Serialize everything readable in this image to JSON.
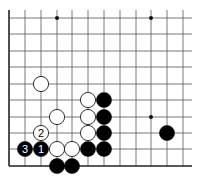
{
  "diagram": {
    "type": "go-board-fragment",
    "grid": {
      "columns_x": [
        9,
        25,
        41,
        57,
        72,
        88,
        104,
        120,
        136,
        151,
        167,
        183
      ],
      "rows_y": [
        18,
        34,
        51,
        67,
        84,
        100,
        117,
        133,
        149,
        166
      ],
      "extend_top_y": 10,
      "extend_right_x": 192,
      "left_edge": true,
      "bottom_edge": true,
      "line_color": "#555555",
      "edge_color": "#222222"
    },
    "star_points": [
      {
        "col": 3,
        "row": 0
      },
      {
        "col": 9,
        "row": 0
      },
      {
        "col": 9,
        "row": 6
      }
    ],
    "stones": [
      {
        "color": "white",
        "col": 2,
        "row": 4,
        "label": ""
      },
      {
        "color": "white",
        "col": 5,
        "row": 5,
        "label": ""
      },
      {
        "color": "black",
        "col": 6,
        "row": 5,
        "label": ""
      },
      {
        "color": "white",
        "col": 3,
        "row": 6,
        "label": ""
      },
      {
        "color": "white",
        "col": 5,
        "row": 6,
        "label": ""
      },
      {
        "color": "black",
        "col": 6,
        "row": 6,
        "label": ""
      },
      {
        "color": "white",
        "col": 2,
        "row": 7,
        "label": "2"
      },
      {
        "color": "white",
        "col": 5,
        "row": 7,
        "label": ""
      },
      {
        "color": "black",
        "col": 6,
        "row": 7,
        "label": ""
      },
      {
        "color": "black",
        "col": 10,
        "row": 7,
        "label": ""
      },
      {
        "color": "black",
        "col": 1,
        "row": 8,
        "label": "3"
      },
      {
        "color": "black",
        "col": 2,
        "row": 8,
        "label": "1"
      },
      {
        "color": "white",
        "col": 3,
        "row": 8,
        "label": ""
      },
      {
        "color": "white",
        "col": 4,
        "row": 8,
        "label": ""
      },
      {
        "color": "black",
        "col": 5,
        "row": 8,
        "label": ""
      },
      {
        "color": "black",
        "col": 6,
        "row": 8,
        "label": ""
      },
      {
        "color": "black",
        "col": 3,
        "row": 9,
        "label": ""
      },
      {
        "color": "black",
        "col": 4,
        "row": 9,
        "label": ""
      }
    ],
    "stone_radius": 7.6
  }
}
